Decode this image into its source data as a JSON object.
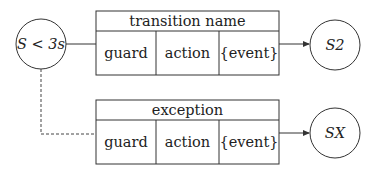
{
  "diagram": {
    "type": "state-transition",
    "states": [
      {
        "id": "source",
        "label": "S < 3s"
      },
      {
        "id": "s2",
        "label": "S2"
      },
      {
        "id": "sx",
        "label": "SX"
      }
    ],
    "transitions": [
      {
        "title": "transition name",
        "cells": [
          "guard",
          "action",
          "{event}"
        ],
        "from": "source",
        "to": "s2",
        "line_style": "solid"
      },
      {
        "title": "exception",
        "cells": [
          "guard",
          "action",
          "{event}"
        ],
        "from": "source",
        "to": "sx",
        "line_style": "dashed"
      }
    ],
    "colors": {
      "stroke": "#333333",
      "text": "#222222",
      "background": "#ffffff"
    }
  }
}
